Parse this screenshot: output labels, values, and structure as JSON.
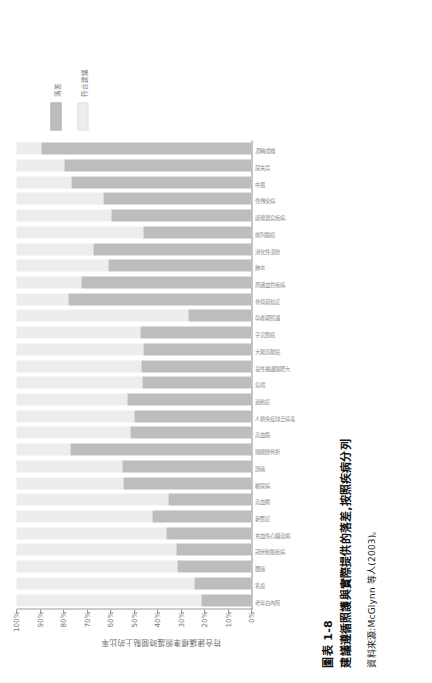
{
  "figure": {
    "number": "圖表 1-8",
    "title": "建議遵循照護與實際提供的落差,按照疾病分列",
    "source": "資料來源:McGlynn 等人(2003)。"
  },
  "legend": {
    "position": "right",
    "items": [
      {
        "label": "落差",
        "color": "#bdbdbd",
        "swatch": "dark-gray-swatch"
      },
      {
        "label": "符合建議",
        "color": "#ededed",
        "swatch": "light-gray-swatch"
      }
    ]
  },
  "chart_data": {
    "type": "bar",
    "title": "建議遵循照護與實際提供的落差,按照疾病分列",
    "xlabel": "",
    "ylabel": "符合建議標準照護時間點上的比率",
    "ylim": [
      0,
      100
    ],
    "grid": false,
    "ticklabels": [
      "100%",
      "90%",
      "80%",
      "70%",
      "60%",
      "50%",
      "40%",
      "30%",
      "20%",
      "10%",
      "0%"
    ],
    "tickvalues": [
      100,
      90,
      80,
      70,
      60,
      50,
      40,
      30,
      20,
      10,
      0
    ],
    "stacked": true,
    "categories": [
      "老年白內障",
      "乳癌",
      "腰痛",
      "冠狀動脈疾病",
      "充血性心臟衰竭",
      "憂鬱症",
      "高血壓",
      "糖尿病",
      "頭痛",
      "髖關節骨折",
      "高血脂",
      "人類免疫缺乏病毒",
      "過動症",
      "氣喘",
      "良性攝護腺肥大",
      "大腸直腸癌",
      "子宮頸癌",
      "孕產期照護",
      "骨質疏鬆症",
      "周邊血管疾病",
      "肺炎",
      "消化性潰瘍",
      "前列腺癌",
      "感覺器官疾病",
      "性傳染病",
      "中風",
      "尿失禁",
      "酒精成癮"
    ],
    "series": [
      {
        "name": "符合建議",
        "color": "#ededed",
        "values": [
          78.7,
          75.7,
          68.5,
          68.0,
          63.9,
          57.7,
          64.7,
          45.4,
          45.2,
          22.8,
          48.6,
          50.4,
          47.4,
          53.5,
          53.0,
          53.9,
          52.7,
          73.0,
          22.1,
          27.8,
          39.0,
          32.7,
          54.2,
          40.4,
          36.9,
          23.5,
          20.4,
          10.5
        ]
      },
      {
        "name": "落差",
        "color": "#bdbdbd",
        "values": [
          21.3,
          24.3,
          31.5,
          32.0,
          36.1,
          42.3,
          35.3,
          54.6,
          54.8,
          77.2,
          51.4,
          49.6,
          52.6,
          46.5,
          47.0,
          46.1,
          47.3,
          27.0,
          77.9,
          72.2,
          61.0,
          67.3,
          45.8,
          59.6,
          63.1,
          76.5,
          79.6,
          89.5
        ]
      }
    ]
  }
}
